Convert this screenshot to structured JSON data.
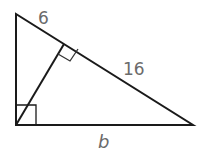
{
  "diagram": {
    "type": "right-triangle-with-altitude",
    "labels": {
      "short_segment": "6",
      "long_segment": "16",
      "base": "b"
    },
    "vertices": {
      "top": [
        16,
        14
      ],
      "right_angle": [
        16,
        125
      ],
      "right": [
        193,
        125
      ],
      "altitude_foot": [
        64,
        44
      ]
    },
    "right_angle_marks": [
      "at right_angle vertex",
      "at altitude foot"
    ],
    "colors": {
      "line": "#1a1a1a",
      "label": "#6b6b6b",
      "background": "#ffffff"
    }
  }
}
